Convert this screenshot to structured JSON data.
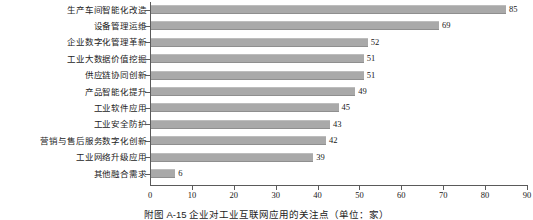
{
  "chart_data": {
    "type": "bar",
    "orientation": "horizontal",
    "title": "",
    "caption": "附图 A-15  企业对工业互联网应用的关注点（单位：家）",
    "xlabel": "",
    "ylabel": "",
    "xlim": [
      0,
      90
    ],
    "xticks": [
      "0",
      "10",
      "20",
      "30",
      "40",
      "50",
      "60",
      "70",
      "80",
      "90"
    ],
    "grid": false,
    "legend": null,
    "bar_color": "#a9a9a9",
    "axis_color": "#5a5a5a",
    "categories": [
      "生产车间智能化改造",
      "设备管理运维",
      "企业数字化管理革新",
      "工业大数据价值挖掘",
      "供应链协同创新",
      "产品智能化提升",
      "工业软件应用",
      "工业安全防护",
      "营销与售后服务数字化创新",
      "工业网络升级应用",
      "其他融合需求"
    ],
    "values": [
      85,
      69,
      52,
      51,
      51,
      49,
      45,
      43,
      42,
      39,
      6
    ],
    "value_labels": [
      "85",
      "69",
      "52",
      "51",
      "51",
      "49",
      "45",
      "43",
      "42",
      "39",
      "6"
    ]
  }
}
